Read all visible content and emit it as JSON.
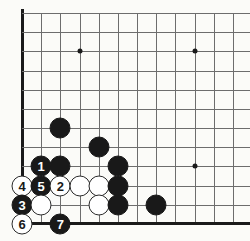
{
  "figure": {
    "name": "go-board-diagram",
    "type": "go-board",
    "board_geometry": {
      "origin_x": 22,
      "origin_y": 13,
      "spacing": 19.17,
      "columns_visible": 12,
      "rows_visible": 11,
      "left_edge_is_board_edge": true,
      "bottom_edge_is_board_edge": true
    },
    "colors": {
      "background": "#fbfbf8",
      "grid_line": "#6d6d6d",
      "board_edge": "#1a1a1a",
      "black_stone": "#191919",
      "white_stone": "#ffffff",
      "stone_outline": "#2a2a2a",
      "black_number_text": "#ffffff",
      "white_number_text": "#191919"
    },
    "star_points": [
      {
        "name": "star-point-upper-left",
        "col": 3,
        "row": 2
      },
      {
        "name": "star-point-upper-right",
        "col": 9,
        "row": 2
      },
      {
        "name": "star-point-lower-right",
        "col": 9,
        "row": 8
      }
    ],
    "stones": [
      {
        "id": "stone-black-a",
        "color": "black",
        "label": "",
        "col": 2,
        "row": 6
      },
      {
        "id": "stone-black-b",
        "color": "black",
        "label": "",
        "col": 4,
        "row": 7
      },
      {
        "id": "stone-black-move-1",
        "color": "black",
        "label": "1",
        "col": 1,
        "row": 8
      },
      {
        "id": "stone-black-c",
        "color": "black",
        "label": "",
        "col": 2,
        "row": 8
      },
      {
        "id": "stone-black-d",
        "color": "black",
        "label": "",
        "col": 5,
        "row": 8
      },
      {
        "id": "stone-white-move-4",
        "color": "white",
        "label": "4",
        "col": 0,
        "row": 9
      },
      {
        "id": "stone-black-move-5",
        "color": "black",
        "label": "5",
        "col": 1,
        "row": 9
      },
      {
        "id": "stone-white-move-2",
        "color": "white",
        "label": "2",
        "col": 2,
        "row": 9
      },
      {
        "id": "stone-white-a",
        "color": "white",
        "label": "",
        "col": 3,
        "row": 9
      },
      {
        "id": "stone-white-b",
        "color": "white",
        "label": "",
        "col": 4,
        "row": 9
      },
      {
        "id": "stone-black-e",
        "color": "black",
        "label": "",
        "col": 5,
        "row": 9
      },
      {
        "id": "stone-black-move-3",
        "color": "black",
        "label": "3",
        "col": 0,
        "row": 10
      },
      {
        "id": "stone-white-c",
        "color": "white",
        "label": "",
        "col": 1,
        "row": 10
      },
      {
        "id": "stone-white-d",
        "color": "white",
        "label": "",
        "col": 4,
        "row": 10
      },
      {
        "id": "stone-black-f",
        "color": "black",
        "label": "",
        "col": 5,
        "row": 10
      },
      {
        "id": "stone-black-g",
        "color": "black",
        "label": "",
        "col": 7,
        "row": 10
      },
      {
        "id": "stone-white-move-6",
        "color": "white",
        "label": "6",
        "col": 0,
        "row": 11
      },
      {
        "id": "stone-black-move-7",
        "color": "black",
        "label": "7",
        "col": 2,
        "row": 11
      }
    ],
    "move_sequence": [
      "1",
      "2",
      "3",
      "4",
      "5",
      "6",
      "7"
    ]
  }
}
